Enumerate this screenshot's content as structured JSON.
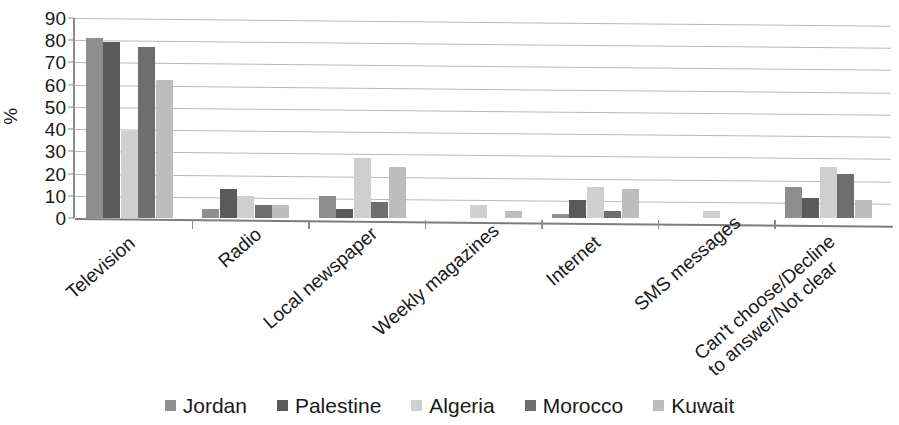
{
  "chart_data": {
    "type": "bar",
    "title": "",
    "subtitle": "",
    "xlabel": "",
    "ylabel": "%",
    "ylim": [
      0,
      90
    ],
    "ytick_step": 10,
    "yticks": [
      0,
      10,
      20,
      30,
      40,
      50,
      60,
      70,
      80,
      90
    ],
    "grid": true,
    "legend_position": "bottom",
    "categories": [
      "Television",
      "Radio",
      "Local newspaper",
      "Weekly magazines",
      "Internet",
      "SMS messages",
      "Can't choose/Decline\nto answer/Not clear"
    ],
    "category_lines": [
      [
        "Television"
      ],
      [
        "Radio"
      ],
      [
        "Local newspaper"
      ],
      [
        "Weekly magazines"
      ],
      [
        "Internet"
      ],
      [
        "SMS messages"
      ],
      [
        "Can't choose/Decline",
        "to answer/Not clear"
      ]
    ],
    "series": [
      {
        "name": "Jordan",
        "color": "#8e8e8e",
        "values": [
          81,
          4,
          10,
          0,
          2,
          0,
          14
        ]
      },
      {
        "name": "Palestine",
        "color": "#5a5a5a",
        "values": [
          79,
          13,
          4,
          0,
          8,
          0,
          9
        ]
      },
      {
        "name": "Algeria",
        "color": "#cfcfcf",
        "values": [
          39,
          10,
          27,
          6,
          14,
          3,
          23
        ]
      },
      {
        "name": "Morocco",
        "color": "#6e6e6e",
        "values": [
          77,
          6,
          7,
          0,
          3,
          0,
          20
        ]
      },
      {
        "name": "Kuwait",
        "color": "#bdbdbd",
        "values": [
          62,
          6,
          23,
          3,
          13,
          0,
          8
        ]
      }
    ]
  },
  "legend": {
    "items": [
      {
        "label": "Jordan"
      },
      {
        "label": "Palestine"
      },
      {
        "label": "Algeria"
      },
      {
        "label": "Morocco"
      },
      {
        "label": "Kuwait"
      }
    ]
  },
  "axis": {
    "y_title": "%",
    "y_labels": [
      "90",
      "80",
      "70",
      "60",
      "50",
      "40",
      "30",
      "20",
      "10",
      "0"
    ]
  }
}
